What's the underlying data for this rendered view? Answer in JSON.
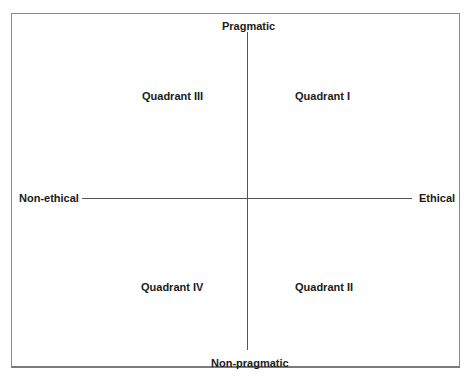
{
  "diagram": {
    "type": "quadrant-matrix",
    "axes": {
      "vertical": {
        "top": "Pragmatic",
        "bottom": "Non-pragmatic"
      },
      "horizontal": {
        "left": "Non-ethical",
        "right": "Ethical"
      }
    },
    "quadrants": {
      "top_left": "Quadrant III",
      "top_right": "Quadrant I",
      "bottom_left": "Quadrant IV",
      "bottom_right": "Quadrant II"
    },
    "colors": {
      "line": "#555555",
      "text": "#1a1a1a",
      "frame": "#8a8a8a"
    }
  }
}
